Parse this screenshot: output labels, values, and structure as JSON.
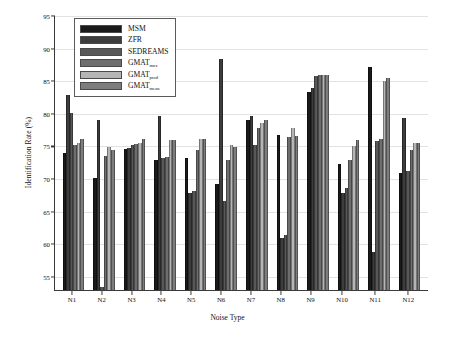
{
  "chart_data": {
    "type": "bar",
    "title": "",
    "xlabel": "Noise Type",
    "ylabel": "Identification Rate (%)",
    "categories": [
      "N1",
      "N2",
      "N3",
      "N4",
      "N5",
      "N6",
      "N7",
      "N8",
      "N9",
      "N10",
      "N11",
      "N12"
    ],
    "ylim": [
      53,
      95
    ],
    "yticks": [
      55,
      60,
      65,
      70,
      75,
      80,
      85,
      90,
      95
    ],
    "grid": true,
    "legend_position": "top-left",
    "series": [
      {
        "name": "MSM",
        "color": "#1a1a1a",
        "values": [
          74.0,
          70.2,
          74.6,
          73.0,
          73.2,
          69.2,
          79.0,
          76.7,
          83.4,
          72.3,
          87.2,
          71.0
        ]
      },
      {
        "name": "ZFR",
        "color": "#3d3d3d",
        "values": [
          82.9,
          79.0,
          74.7,
          79.7,
          67.8,
          88.4,
          79.7,
          61.0,
          84.0,
          67.9,
          58.9,
          79.4
        ]
      },
      {
        "name": "SEDREAMS",
        "color": "#585858",
        "values": [
          80.1,
          53.4,
          75.2,
          73.3,
          68.2,
          66.7,
          75.3,
          61.5,
          85.8,
          68.7,
          75.9,
          71.3
        ]
      },
      {
        "name": "GMAT_max",
        "color": "#6e6e6e",
        "values": [
          75.2,
          73.5,
          75.4,
          73.4,
          74.5,
          72.9,
          77.9,
          76.4,
          85.9,
          72.9,
          76.1,
          74.5
        ]
      },
      {
        "name": "GMAT_prod",
        "color": "#b5b5b5",
        "values": [
          75.5,
          74.9,
          75.6,
          76.0,
          76.1,
          75.2,
          78.6,
          77.8,
          86.0,
          75.0,
          85.0,
          75.6
        ]
      },
      {
        "name": "GMAT_mean",
        "color": "#7d7d7d",
        "values": [
          76.1,
          74.4,
          76.2,
          76.0,
          76.2,
          74.9,
          79.0,
          76.6,
          86.0,
          76.0,
          85.5,
          75.5
        ]
      }
    ],
    "legend_labels": [
      {
        "base": "MSM",
        "sub": ""
      },
      {
        "base": "ZFR",
        "sub": ""
      },
      {
        "base": "SEDREAMS",
        "sub": ""
      },
      {
        "base": "GMAT",
        "sub": "max"
      },
      {
        "base": "GMAT",
        "sub": "prod"
      },
      {
        "base": "GMAT",
        "sub": "mean"
      }
    ]
  }
}
